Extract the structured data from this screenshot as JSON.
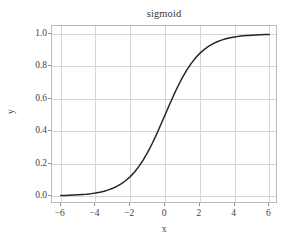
{
  "figure": {
    "width": 293,
    "height": 243,
    "background": "#ffffff"
  },
  "axis_label_x": "x",
  "axis_label_y": "y",
  "chart_data": {
    "type": "line",
    "title": "sigmoid",
    "xlabel": "x",
    "ylabel": "y",
    "grid": true,
    "legend": null,
    "legend_position": null,
    "xlim": [
      -6.5,
      6.5
    ],
    "ylim": [
      -0.05,
      1.05
    ],
    "xticks": [
      -6,
      -4,
      -2,
      0,
      2,
      4,
      6
    ],
    "xticklabels": [
      "−6",
      "−4",
      "−2",
      "0",
      "2",
      "4",
      "6"
    ],
    "yticks": [
      0.0,
      0.2,
      0.4,
      0.6,
      0.8,
      1.0
    ],
    "yticklabels": [
      "0.0",
      "0.2",
      "0.4",
      "0.6",
      "0.8",
      "1.0"
    ],
    "line_color": "#262626",
    "line_width": 1.5,
    "grid_color": "#d6d6d6",
    "frame_color": "#b9b9b9",
    "series": [
      {
        "name": "sigmoid",
        "formula": "1 / (1 + exp(-x))",
        "x": [
          -6.0,
          -5.75,
          -5.5,
          -5.25,
          -5.0,
          -4.75,
          -4.5,
          -4.25,
          -4.0,
          -3.75,
          -3.5,
          -3.25,
          -3.0,
          -2.75,
          -2.5,
          -2.25,
          -2.0,
          -1.75,
          -1.5,
          -1.25,
          -1.0,
          -0.75,
          -0.5,
          -0.25,
          0.0,
          0.25,
          0.5,
          0.75,
          1.0,
          1.25,
          1.5,
          1.75,
          2.0,
          2.25,
          2.5,
          2.75,
          3.0,
          3.25,
          3.5,
          3.75,
          4.0,
          4.25,
          4.5,
          4.75,
          5.0,
          5.25,
          5.5,
          5.75,
          6.0
        ],
        "y": [
          0.0025,
          0.0032,
          0.0041,
          0.0052,
          0.0067,
          0.0086,
          0.011,
          0.0141,
          0.018,
          0.023,
          0.0293,
          0.0374,
          0.0474,
          0.0601,
          0.0759,
          0.0952,
          0.1192,
          0.148,
          0.1824,
          0.2227,
          0.2689,
          0.3208,
          0.3775,
          0.4378,
          0.5,
          0.5622,
          0.6225,
          0.6792,
          0.7311,
          0.7773,
          0.8176,
          0.852,
          0.8808,
          0.9046,
          0.9241,
          0.9399,
          0.9526,
          0.9626,
          0.9707,
          0.977,
          0.982,
          0.9859,
          0.989,
          0.9914,
          0.9933,
          0.9948,
          0.9959,
          0.9968,
          0.9975
        ]
      }
    ]
  }
}
